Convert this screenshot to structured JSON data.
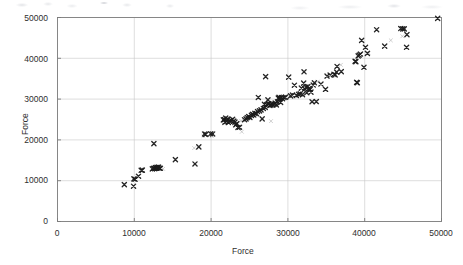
{
  "chart_data": {
    "type": "scatter",
    "title": "",
    "xlabel": "Force",
    "ylabel": "Force",
    "xlim": [
      0,
      50000
    ],
    "ylim": [
      0,
      50000
    ],
    "xticks": [
      "0",
      "10000",
      "20000",
      "30000",
      "40000",
      "50000"
    ],
    "yticks": [
      "0",
      "10000",
      "20000",
      "30000",
      "40000",
      "50000"
    ],
    "xtick_values": [
      0,
      10000,
      20000,
      30000,
      40000,
      50000
    ],
    "ytick_values": [
      0,
      10000,
      20000,
      30000,
      40000,
      50000
    ],
    "grid": true,
    "legend": null,
    "marker": "x",
    "marker_color": "#1a1a1a",
    "series": [
      {
        "name": "Force vs Force",
        "marker": "x",
        "points": [
          [
            8700,
            9050
          ],
          [
            9900,
            8650
          ],
          [
            9950,
            10450
          ],
          [
            10100,
            10350
          ],
          [
            10550,
            11100
          ],
          [
            10900,
            12550
          ],
          [
            11050,
            12600
          ],
          [
            12350,
            12900
          ],
          [
            12500,
            13050
          ],
          [
            12650,
            12950
          ],
          [
            12750,
            13200
          ],
          [
            12850,
            13100
          ],
          [
            12950,
            13250
          ],
          [
            13050,
            13150
          ],
          [
            13150,
            13350
          ],
          [
            13250,
            13050
          ],
          [
            13400,
            13050
          ],
          [
            12550,
            19100
          ],
          [
            15350,
            15150
          ],
          [
            17900,
            14100
          ],
          [
            19150,
            21450
          ],
          [
            19300,
            21350
          ],
          [
            19950,
            21500
          ],
          [
            20200,
            21450
          ],
          [
            18400,
            18300
          ],
          [
            21600,
            24900
          ],
          [
            21750,
            25000
          ],
          [
            21800,
            24350
          ],
          [
            21900,
            25350
          ],
          [
            22050,
            24600
          ],
          [
            22150,
            25100
          ],
          [
            22250,
            24300
          ],
          [
            22400,
            24600
          ],
          [
            22600,
            24800
          ],
          [
            22800,
            25050
          ],
          [
            22950,
            24600
          ],
          [
            23100,
            24350
          ],
          [
            23200,
            23700
          ],
          [
            23350,
            24000
          ],
          [
            23500,
            23050
          ],
          [
            23700,
            23100
          ],
          [
            24350,
            24950
          ],
          [
            24550,
            25150
          ],
          [
            24700,
            25500
          ],
          [
            24900,
            25700
          ],
          [
            25050,
            25500
          ],
          [
            25250,
            26000
          ],
          [
            25400,
            26250
          ],
          [
            25550,
            26100
          ],
          [
            25700,
            26500
          ],
          [
            25900,
            26450
          ],
          [
            26050,
            26950
          ],
          [
            26150,
            30400
          ],
          [
            26300,
            27100
          ],
          [
            26500,
            27350
          ],
          [
            26650,
            25150
          ],
          [
            26800,
            27700
          ],
          [
            26950,
            28700
          ],
          [
            27050,
            27950
          ],
          [
            27100,
            35500
          ],
          [
            27250,
            28650
          ],
          [
            27400,
            29800
          ],
          [
            27500,
            28900
          ],
          [
            27650,
            28450
          ],
          [
            27800,
            28600
          ],
          [
            27950,
            28800
          ],
          [
            28050,
            28550
          ],
          [
            28200,
            28750
          ],
          [
            28350,
            29000
          ],
          [
            28500,
            28600
          ],
          [
            28650,
            29350
          ],
          [
            28750,
            30250
          ],
          [
            28850,
            30450
          ],
          [
            28950,
            30100
          ],
          [
            29050,
            29200
          ],
          [
            29150,
            30400
          ],
          [
            29300,
            30100
          ],
          [
            29500,
            30400
          ],
          [
            29700,
            30500
          ],
          [
            30100,
            35400
          ],
          [
            30350,
            30800
          ],
          [
            30600,
            31000
          ],
          [
            30850,
            33400
          ],
          [
            31100,
            30900
          ],
          [
            31400,
            31150
          ],
          [
            31600,
            31300
          ],
          [
            31750,
            32700
          ],
          [
            31900,
            31100
          ],
          [
            32050,
            33900
          ],
          [
            32200,
            32500
          ],
          [
            32350,
            32950
          ],
          [
            32450,
            31550
          ],
          [
            32600,
            33050
          ],
          [
            32750,
            32550
          ],
          [
            32900,
            32400
          ],
          [
            33000,
            31700
          ],
          [
            33150,
            29350
          ],
          [
            33300,
            33450
          ],
          [
            33450,
            34000
          ],
          [
            32100,
            36700
          ],
          [
            33700,
            29400
          ],
          [
            34300,
            33700
          ],
          [
            34900,
            32400
          ],
          [
            35100,
            35650
          ],
          [
            35500,
            35900
          ],
          [
            36000,
            36100
          ],
          [
            36150,
            35950
          ],
          [
            36350,
            36600
          ],
          [
            36400,
            38000
          ],
          [
            36950,
            36750
          ],
          [
            38750,
            39250
          ],
          [
            38850,
            39200
          ],
          [
            38950,
            34100
          ],
          [
            39050,
            34000
          ],
          [
            39150,
            40600
          ],
          [
            39300,
            40800
          ],
          [
            39450,
            41050
          ],
          [
            39600,
            44400
          ],
          [
            39900,
            37800
          ],
          [
            40100,
            42700
          ],
          [
            40350,
            41200
          ],
          [
            41550,
            47000
          ],
          [
            42600,
            43000
          ],
          [
            44700,
            47300
          ],
          [
            44950,
            47200
          ],
          [
            45150,
            47200
          ],
          [
            45450,
            42700
          ],
          [
            45500,
            45800
          ],
          [
            49500,
            49800
          ]
        ]
      }
    ],
    "faint_points": [
      [
        10450,
        11100
      ],
      [
        13750,
        12900
      ],
      [
        19000,
        20950
      ],
      [
        20100,
        20900
      ],
      [
        21700,
        24000
      ],
      [
        23000,
        23900
      ],
      [
        23900,
        24700
      ],
      [
        25600,
        26200
      ],
      [
        26600,
        27200
      ],
      [
        29300,
        29900
      ],
      [
        33900,
        34300
      ],
      [
        35900,
        35700
      ],
      [
        36900,
        38400
      ],
      [
        40500,
        41300
      ],
      [
        43400,
        44400
      ],
      [
        44900,
        45400
      ],
      [
        24000,
        22000
      ],
      [
        27800,
        24600
      ],
      [
        17800,
        18000
      ],
      [
        31200,
        30600
      ]
    ]
  },
  "axes": {
    "x_title": "Force",
    "y_title": "Force"
  }
}
